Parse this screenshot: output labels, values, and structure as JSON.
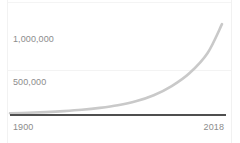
{
  "chart_data": {
    "type": "line",
    "title": "",
    "subtitle": "",
    "xlabel": "",
    "ylabel": "",
    "xlim": [
      1900,
      2018
    ],
    "ylim": [
      0,
      1100000
    ],
    "grid": true,
    "legend": false,
    "legend_position": "none",
    "y_ticks": [
      {
        "value": 500000,
        "label": "500,000"
      },
      {
        "value": 1000000,
        "label": "1,000,000"
      }
    ],
    "x_ticks": [
      {
        "value": 1900,
        "label": "1900"
      },
      {
        "value": 2018,
        "label": "2018"
      }
    ],
    "series": [
      {
        "name": "",
        "color": "#c9c9c9",
        "x": [
          1900,
          1910,
          1920,
          1930,
          1940,
          1950,
          1960,
          1970,
          1980,
          1990,
          2000,
          2010,
          2018
        ],
        "values": [
          9000,
          14000,
          22000,
          33000,
          48000,
          70000,
          100000,
          145000,
          215000,
          320000,
          470000,
          700000,
          1030000
        ]
      }
    ]
  },
  "axis": {
    "baseline_color": "#4f4f4f",
    "tick_label_color": "#8c8c8c",
    "gridline_color": "#f3f3f3"
  },
  "y_tick_labels": {
    "top": "1,000,000",
    "middle": "500,000"
  },
  "x_tick_labels": {
    "start": "1900",
    "end": "2018"
  }
}
